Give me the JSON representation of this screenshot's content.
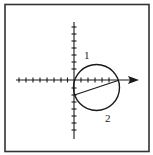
{
  "diagram": {
    "type": "coordinate-plane-with-circle",
    "labels": {
      "region_1": "1",
      "region_2": "2"
    },
    "colors": {
      "stroke": "#1a1a1a",
      "background": "#ffffff",
      "frame": "#333333"
    },
    "x_axis": {
      "ticks_left": 8,
      "ticks_right": 5,
      "has_arrow": true
    },
    "y_axis": {
      "ticks_up": 7,
      "ticks_down": 7,
      "has_arrow": false
    },
    "circle": {
      "passes_through_origin": true,
      "center_units": [
        3,
        -1.1
      ],
      "tangent_point_on_x_axis_units": 6
    },
    "chord": {
      "from_units": [
        6,
        0
      ],
      "to_units": [
        0,
        -2
      ]
    }
  }
}
